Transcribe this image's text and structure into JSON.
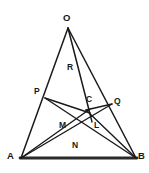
{
  "figure": {
    "background_color": "#ffffff",
    "stroke_color": "#1a1a1a",
    "base_stroke_color": "#2b2b2b",
    "canvas": {
      "width": 149,
      "height": 173
    }
  },
  "labels": {
    "O": "O",
    "A": "A",
    "B": "B",
    "P": "P",
    "Q": "Q",
    "C": "C",
    "M": "M",
    "L": "L",
    "R": "R",
    "N": "N"
  },
  "points": {
    "O": {
      "x": 68,
      "y": 27,
      "label": "O",
      "kind": "vertex"
    },
    "A": {
      "x": 21,
      "y": 158,
      "label": "A",
      "kind": "vertex"
    },
    "B": {
      "x": 136,
      "y": 158,
      "label": "B",
      "kind": "vertex"
    },
    "P": {
      "x": 45,
      "y": 97,
      "label": "P",
      "kind": "point-on-side"
    },
    "Q": {
      "x": 111,
      "y": 106,
      "label": "Q",
      "kind": "point-on-side"
    },
    "C": {
      "x": 88,
      "y": 106,
      "label": "C",
      "kind": "interior-point"
    },
    "M": {
      "x": 78,
      "y": 117,
      "label": "M",
      "kind": "intersection"
    },
    "L": {
      "x": 96,
      "y": 119,
      "label": "L",
      "kind": "intersection"
    },
    "R": {
      "x": 74,
      "y": 72,
      "label": "R",
      "kind": "region"
    },
    "N": {
      "x": 79,
      "y": 152,
      "label": "N",
      "kind": "region"
    }
  },
  "segments": [
    {
      "name": "OA",
      "from": "O",
      "to": "A",
      "width": 1.4
    },
    {
      "name": "OB",
      "from": "O",
      "to": "B",
      "width": 1.4
    },
    {
      "name": "AB",
      "from": "A",
      "to": "B",
      "width": 2.6
    },
    {
      "name": "OC-extended",
      "from": "O",
      "to": "L-lower",
      "width": 1.4
    },
    {
      "name": "AQ",
      "from": "A",
      "to": "Q",
      "width": 1.4
    },
    {
      "name": "AC",
      "from": "A",
      "to": "C",
      "width": 1.4
    },
    {
      "name": "BP",
      "from": "B",
      "to": "P",
      "width": 1.4
    },
    {
      "name": "BC",
      "from": "B",
      "to": "C",
      "width": 1.4
    },
    {
      "name": "PC",
      "from": "P",
      "to": "C-lower",
      "width": 1.4
    }
  ],
  "label_positions": {
    "O": {
      "left": 63,
      "top": 14
    },
    "A": {
      "left": 8,
      "top": 152
    },
    "B": {
      "left": 138,
      "top": 152
    },
    "P": {
      "left": 35,
      "top": 88
    },
    "Q": {
      "left": 113,
      "top": 98
    },
    "C": {
      "left": 86,
      "top": 96
    },
    "M": {
      "left": 60,
      "top": 122
    },
    "L": {
      "left": 94,
      "top": 122
    },
    "R": {
      "left": 68,
      "top": 64
    },
    "N": {
      "left": 73,
      "top": 142
    }
  }
}
